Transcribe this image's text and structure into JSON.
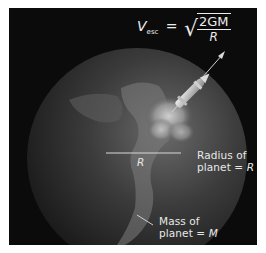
{
  "figure": {
    "background": "#0b0b0b",
    "page_background": "#ffffff",
    "equation": {
      "lhs_symbol": "V",
      "lhs_subscript": "esc",
      "equals": "=",
      "radical": "√",
      "numerator": "2GM",
      "denominator": "R"
    },
    "labels": {
      "radius_line": "R",
      "radius_text_line1": "Radius of",
      "radius_text_line2": "planet = ",
      "radius_symbol": "R",
      "mass_text_line1": "Mass of",
      "mass_text_line2": "planet = ",
      "mass_symbol": "M"
    },
    "elements": [
      "planet-earth",
      "rocket",
      "exhaust-cloud",
      "trajectory-arrow",
      "radius-line",
      "mass-pointer"
    ]
  }
}
